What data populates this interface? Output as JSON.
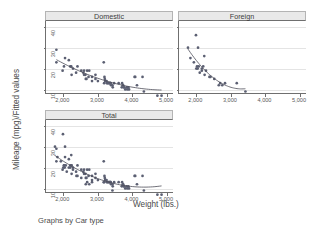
{
  "figure": {
    "ylabel": "Mileage (mpg)/Fitted values",
    "xlabel": "Weight (lbs.)",
    "footnote": "Graphs by Car type",
    "marker_color": "#5b5f72",
    "fitline_color": "#4c4c58",
    "panel_title_bg": "#e9e9e9",
    "axis_color": "#6f6f6f"
  },
  "chart_data": {
    "type": "scatter",
    "title": "",
    "xlabel": "Weight (lbs.)",
    "ylabel": "Mileage (mpg)/Fitted values",
    "xlim": [
      1500,
      5200
    ],
    "ylim": [
      8,
      43
    ],
    "xticks": [
      2000,
      3000,
      4000,
      5000
    ],
    "xticklabels": [
      "2,000",
      "3,000",
      "4,000",
      "5,000"
    ],
    "yticks": [
      10,
      20,
      30,
      40
    ],
    "yticklabels": [
      "10",
      "20",
      "30",
      "40"
    ],
    "grid": "horizontal",
    "legend": "none",
    "by_variable": "Car type",
    "panels": [
      {
        "label": "Domestic",
        "n": 52,
        "x": [
          1800,
          1800,
          1980,
          2020,
          2050,
          2160,
          2200,
          2230,
          2240,
          2280,
          2370,
          2410,
          2520,
          2580,
          2600,
          2600,
          2640,
          2650,
          2670,
          2690,
          2730,
          2750,
          2830,
          2830,
          2930,
          2930,
          3000,
          3170,
          3180,
          3190,
          3200,
          3210,
          3220,
          3250,
          3260,
          3280,
          3310,
          3330,
          3350,
          3360,
          3370,
          3380,
          3420,
          3430,
          3470,
          3600,
          3690,
          3700,
          3720,
          3730,
          3740,
          3760,
          3790,
          3830,
          3850,
          3880,
          3900,
          4060,
          4080,
          4130,
          4290,
          4330,
          4720,
          4840
        ],
        "y": [
          34,
          28,
          24,
          26,
          30,
          29,
          26,
          26,
          22,
          25,
          23,
          26,
          24,
          23,
          24,
          22,
          22,
          20,
          20,
          24,
          21,
          24,
          21,
          19,
          20,
          22,
          19,
          28,
          18,
          21,
          20,
          19,
          19,
          19,
          18,
          18,
          18,
          18,
          18,
          18,
          18,
          17,
          17,
          16,
          18,
          18,
          16,
          18,
          17,
          17,
          16,
          16,
          15,
          16,
          15,
          16,
          15,
          21,
          21,
          17,
          21,
          14,
          12,
          12
        ],
        "fit_x": [
          1800,
          4840
        ],
        "fit_y_note": "quadratic-in-weight fit declining from ~29 at 1800 lbs to ~13 at 4840 lbs"
      },
      {
        "label": "Foreign",
        "n": 22,
        "x": [
          1760,
          1830,
          1930,
          1990,
          2000,
          2020,
          2040,
          2050,
          2070,
          2100,
          2160,
          2160,
          2200,
          2230,
          2240,
          2280,
          2380,
          2410,
          2520,
          2650,
          2690,
          2750,
          2830,
          3170,
          3420
        ],
        "y": [
          35,
          30,
          28,
          41,
          25,
          26,
          25,
          35,
          26,
          23,
          25,
          24,
          26,
          31,
          22,
          24,
          21,
          21,
          20,
          17,
          18,
          17,
          18,
          18,
          14
        ],
        "fit_x": [
          1760,
          3420
        ],
        "fit_y_note": "fit declining from ~29 at 1760 lbs to ~18 at 3420 lbs"
      },
      {
        "label": "Total",
        "n": 74,
        "x": [
          1760,
          1800,
          1800,
          1830,
          1930,
          1980,
          1990,
          2000,
          2020,
          2020,
          2040,
          2050,
          2050,
          2070,
          2100,
          2160,
          2160,
          2200,
          2200,
          2230,
          2230,
          2240,
          2240,
          2280,
          2280,
          2370,
          2380,
          2410,
          2410,
          2520,
          2520,
          2580,
          2600,
          2600,
          2640,
          2650,
          2650,
          2670,
          2690,
          2690,
          2730,
          2750,
          2750,
          2830,
          2830,
          2830,
          2930,
          2930,
          3000,
          3170,
          3170,
          3180,
          3190,
          3200,
          3210,
          3220,
          3250,
          3260,
          3280,
          3310,
          3330,
          3350,
          3360,
          3370,
          3380,
          3420,
          3420,
          3430,
          3470,
          3600,
          3690,
          3700,
          3720,
          3730,
          3740,
          3760,
          3790,
          3830,
          3850,
          3880,
          3900,
          4060,
          4080,
          4130,
          4290,
          4330,
          4720,
          4840
        ],
        "y": [
          35,
          34,
          28,
          30,
          28,
          24,
          41,
          25,
          26,
          26,
          25,
          30,
          35,
          26,
          23,
          29,
          25,
          26,
          25,
          26,
          31,
          26,
          22,
          25,
          24,
          23,
          21,
          26,
          21,
          24,
          20,
          23,
          24,
          22,
          22,
          20,
          17,
          20,
          24,
          18,
          21,
          24,
          17,
          21,
          19,
          18,
          20,
          22,
          19,
          28,
          18,
          18,
          21,
          20,
          19,
          19,
          19,
          18,
          18,
          18,
          18,
          18,
          18,
          18,
          17,
          17,
          14,
          16,
          18,
          18,
          16,
          18,
          17,
          17,
          16,
          16,
          15,
          16,
          15,
          16,
          15,
          21,
          21,
          17,
          21,
          14,
          12,
          12
        ],
        "fit_x": [
          1760,
          4840
        ],
        "fit_y_note": "fit declining from ~29 at 1760 lbs to ~14 at 4840 lbs"
      }
    ]
  }
}
